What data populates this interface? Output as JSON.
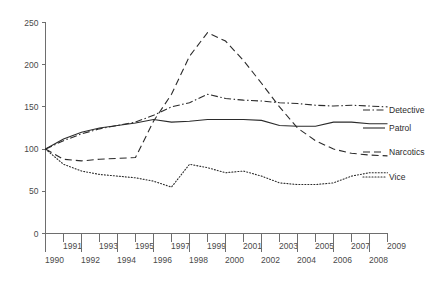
{
  "chart_data": {
    "type": "line",
    "title": "",
    "xlabel": "",
    "ylabel": "",
    "x": [
      1990,
      1991,
      1992,
      1993,
      1994,
      1995,
      1996,
      1997,
      1998,
      1999,
      2000,
      2001,
      2002,
      2003,
      2004,
      2005,
      2006,
      2007,
      2008,
      2009
    ],
    "xlim": [
      1990,
      2009
    ],
    "ylim": [
      0,
      250
    ],
    "yticks": [
      0,
      50,
      100,
      150,
      200,
      250
    ],
    "xticks": [
      1990,
      1991,
      1992,
      1993,
      1994,
      1995,
      1996,
      1997,
      1998,
      1999,
      2000,
      2001,
      2002,
      2003,
      2004,
      2005,
      2006,
      2007,
      2008,
      2009
    ],
    "xtick_labels_upper": [
      "1991",
      "1993",
      "1995",
      "1997",
      "1999",
      "2001",
      "2003",
      "2005",
      "2007",
      "2009"
    ],
    "xtick_labels_lower": [
      "1990",
      "1992",
      "1994",
      "1996",
      "1998",
      "2000",
      "2002",
      "2004",
      "2006",
      "2008"
    ],
    "grid": false,
    "legend_position": "right-inline",
    "series": [
      {
        "name": "Detective",
        "style": "dash-dot",
        "color": "#2b2b2b",
        "values": [
          100,
          110,
          118,
          124,
          128,
          132,
          140,
          150,
          155,
          165,
          160,
          158,
          157,
          155,
          154,
          152,
          151,
          152,
          151,
          150
        ]
      },
      {
        "name": "Patrol",
        "style": "solid",
        "color": "#2b2b2b",
        "values": [
          100,
          112,
          120,
          125,
          128,
          131,
          135,
          132,
          133,
          135,
          135,
          135,
          134,
          128,
          127,
          127,
          132,
          132,
          130,
          130
        ]
      },
      {
        "name": "Narcotics",
        "style": "dashed",
        "color": "#2b2b2b",
        "values": [
          100,
          88,
          86,
          88,
          89,
          90,
          133,
          165,
          210,
          238,
          228,
          205,
          178,
          150,
          125,
          110,
          100,
          95,
          93,
          92
        ]
      },
      {
        "name": "Vice",
        "style": "dotted",
        "color": "#2b2b2b",
        "values": [
          100,
          82,
          74,
          70,
          68,
          66,
          62,
          55,
          82,
          78,
          72,
          74,
          68,
          60,
          58,
          58,
          60,
          68,
          72,
          72
        ]
      }
    ]
  },
  "axis": {
    "y_tick_labels": [
      "250",
      "200",
      "150",
      "100",
      "50",
      "0"
    ]
  },
  "legend": {
    "items": [
      {
        "label": "Detective"
      },
      {
        "label": "Patrol"
      },
      {
        "label": "Narcotics"
      },
      {
        "label": "Vice"
      }
    ]
  }
}
